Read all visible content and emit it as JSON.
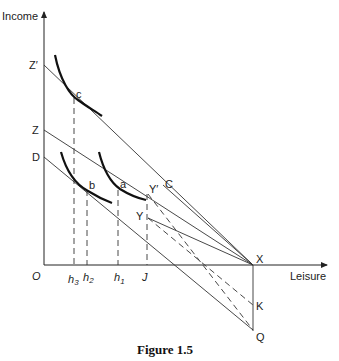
{
  "figure": {
    "caption": "Figure 1.5",
    "y_axis_label": "Income",
    "x_axis_label": "Leisure",
    "origin_label": "O"
  },
  "points": {
    "z_prime": "Z′",
    "z": "Z",
    "d": "D",
    "c": "c",
    "b": "b",
    "a": "a",
    "y_prime": "Y′",
    "y": "Y",
    "c_line": "C",
    "x": "X",
    "k": "K",
    "q": "Q"
  },
  "x_ticks": {
    "h3": {
      "base": "h",
      "sub": "3"
    },
    "h2": {
      "base": "h",
      "sub": "2"
    },
    "h1": {
      "base": "h",
      "sub": "1"
    },
    "j": "J"
  }
}
